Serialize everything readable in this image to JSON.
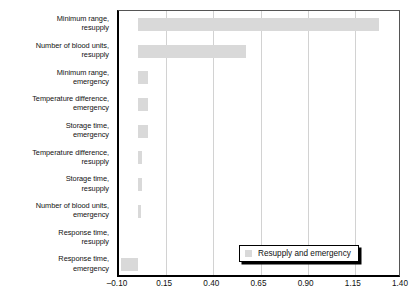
{
  "chart_data": {
    "type": "bar",
    "orientation": "horizontal",
    "title": "",
    "xlabel": "",
    "ylabel": "",
    "xlim": [
      -0.1,
      1.4
    ],
    "xticks": [
      "–0.10",
      "0.15",
      "0.40",
      "0.65",
      "0.90",
      "1.15",
      "1.40"
    ],
    "xtick_values": [
      -0.1,
      0.15,
      0.4,
      0.65,
      0.9,
      1.15,
      1.4
    ],
    "grid": "vertical",
    "legend": {
      "position": "bottom-right",
      "entries": [
        {
          "label": "Resupply and emergency",
          "color": "#d9d9d9"
        }
      ]
    },
    "bar_color": "#d9d9d9",
    "categories": [
      "Minimum range, resupply",
      "Number of blood units, resupply",
      "Minimum range, emergency",
      "Temperature difference, emergency",
      "Storage time, emergency",
      "Temperature difference, resupply",
      "Storage time, resupply",
      "Number of blood units, emergency",
      "Response time, resupply",
      "Response time, emergency"
    ],
    "category_lines": [
      [
        "Minimum range,",
        "resupply"
      ],
      [
        "Number of blood units,",
        "resupply"
      ],
      [
        "Minimum range,",
        "emergency"
      ],
      [
        "Temperature difference,",
        "emergency"
      ],
      [
        "Storage time,",
        "emergency"
      ],
      [
        "Temperature difference,",
        "resupply"
      ],
      [
        "Storage time,",
        "resupply"
      ],
      [
        "Number of blood units,",
        "emergency"
      ],
      [
        "Response time,",
        "resupply"
      ],
      [
        "Response time,",
        "emergency"
      ]
    ],
    "values": [
      1.28,
      0.575,
      0.053,
      0.053,
      0.053,
      0.022,
      0.022,
      0.016,
      0.0,
      -0.09
    ],
    "series": [
      {
        "name": "Resupply and emergency",
        "values": [
          1.28,
          0.575,
          0.053,
          0.053,
          0.053,
          0.022,
          0.022,
          0.016,
          0.0,
          -0.09
        ]
      }
    ]
  }
}
